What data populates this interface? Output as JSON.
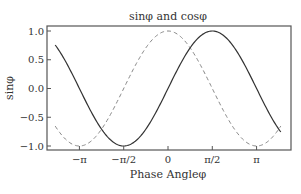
{
  "chart_data": {
    "type": "line",
    "title": "sinφ and cosφ",
    "xlabel": "Phase Angleφ",
    "ylabel": "sinφ",
    "xlim": [
      -4,
      4
    ],
    "ylim": [
      -1.08,
      1.08
    ],
    "grid": false,
    "legend": null,
    "x_ticks": [
      {
        "value": -3.14159,
        "label": "−π"
      },
      {
        "value": -1.5708,
        "label": "−π/2"
      },
      {
        "value": 0,
        "label": "0"
      },
      {
        "value": 1.5708,
        "label": "π/2"
      },
      {
        "value": 3.14159,
        "label": "π"
      }
    ],
    "y_ticks": [
      {
        "value": 1.0,
        "label": "1.0"
      },
      {
        "value": 0.5,
        "label": "0.5"
      },
      {
        "value": 0.0,
        "label": "0.0"
      },
      {
        "value": -0.5,
        "label": "−0.5"
      },
      {
        "value": -1.0,
        "label": "−1.0"
      }
    ],
    "series": [
      {
        "name": "sinφ",
        "style": "solid",
        "color": "#333333",
        "function": "sin",
        "x": [
          -4,
          -3.14159,
          -1.5708,
          0,
          1.5708,
          3.14159,
          4
        ],
        "values": [
          0.757,
          0.0,
          -1.0,
          0.0,
          1.0,
          0.0,
          -0.757
        ]
      },
      {
        "name": "cosφ",
        "style": "dashed",
        "color": "#888888",
        "function": "cos",
        "x": [
          -4,
          -3.14159,
          -1.5708,
          0,
          1.5708,
          3.14159,
          4
        ],
        "values": [
          -0.654,
          -1.0,
          0.0,
          1.0,
          0.0,
          -1.0,
          -0.654
        ]
      }
    ]
  }
}
